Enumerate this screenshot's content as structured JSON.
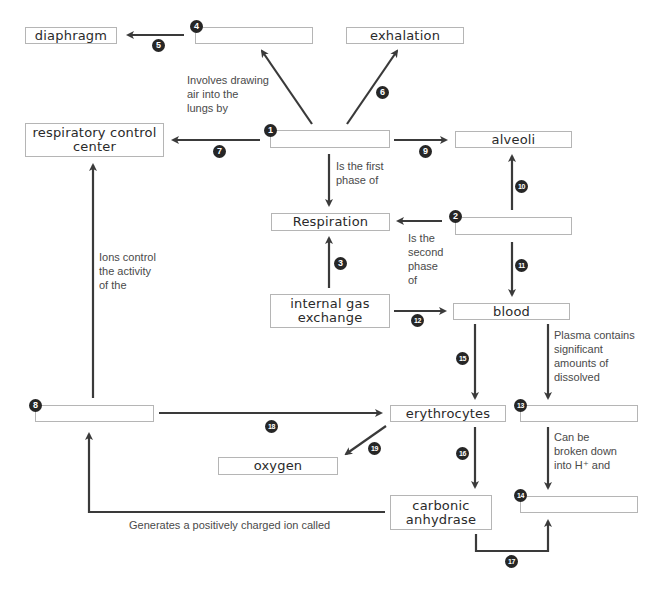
{
  "diagram": {
    "type": "concept map",
    "topic": "Respiration",
    "concepts": {
      "diaphragm": "diaphragm",
      "box4": "",
      "exhalation": "exhalation",
      "respiratory_control_center": "respiratory control center",
      "box1": "",
      "alveoli": "alveoli",
      "respiration": "Respiration",
      "box2": "",
      "internal_gas_exchange": "internal gas exchange",
      "blood": "blood",
      "box8": "",
      "erythrocytes": "erythrocytes",
      "box13": "",
      "oxygen": "oxygen",
      "carbonic_anhydrase": "carbonic anhydrase",
      "box14": ""
    },
    "linking_phrases": {
      "involves_drawing": "Involves drawing\nair into the\nlungs by",
      "first_phase": "Is the first\nphase of",
      "second_phase": "Is the\nsecond\nphase\nof",
      "ions_control": "Ions control\nthe activity\nof the",
      "plasma_contains": "Plasma contains\nsignificant\namounts of\ndissolved",
      "broken_down": "Can be\nbroken down\ninto H⁺ and",
      "generates_ion": "Generates a positively charged ion called"
    },
    "numbers": {
      "n1": "1",
      "n2": "2",
      "n3": "3",
      "n4": "4",
      "n5": "5",
      "n6": "6",
      "n7": "7",
      "n8": "8",
      "n9": "9",
      "n10": "10",
      "n11": "11",
      "n12": "12",
      "n13": "13",
      "n14": "14",
      "n15": "15",
      "n16": "16",
      "n17": "17",
      "n18": "18",
      "n19": "19"
    },
    "colors": {
      "arrow": "#3a3a3a",
      "box_border": "#b5b5b5",
      "label_text": "#4a4a4a",
      "number_badge": "#262626"
    }
  }
}
